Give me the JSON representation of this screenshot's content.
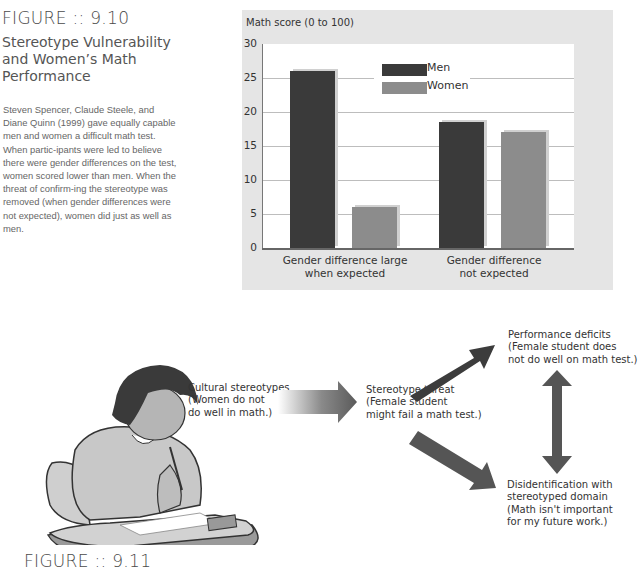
{
  "figure_9_10": {
    "label": "FIGURE :: 9.10",
    "title": "Stereotype Vulnerability and Women’s Math Performance",
    "caption": "Steven Spencer, Claude Steele, and Diane Quinn (1999) gave equally capable men and women a difficult math test. When partic-ipants were led to believe there were gender differences on the test, women scored lower than men. When the threat of confirm-ing the stereotype was removed (when gender differences were not expected), women did just as well as men."
  },
  "chart_data": {
    "type": "bar",
    "title": "",
    "ylabel": "Math score (0 to 100)",
    "xlabel": "",
    "ylim": [
      0,
      30
    ],
    "yticks": [
      "0",
      "5",
      "10",
      "15",
      "20",
      "25",
      "30"
    ],
    "grid": true,
    "legend_position": "top-center inside plot",
    "categories": [
      "Gender difference large when expected",
      "Gender difference not expected"
    ],
    "category_lines": [
      [
        "Gender difference large",
        "when expected"
      ],
      [
        "Gender difference",
        "not expected"
      ]
    ],
    "series": [
      {
        "name": "Men",
        "color": "#3a3a3a",
        "values": [
          26,
          18.5
        ]
      },
      {
        "name": "Women",
        "color": "#8c8c8c",
        "values": [
          6,
          17
        ]
      }
    ]
  },
  "figure_9_11": {
    "label": "FIGURE :: 9.11",
    "illustration": "girl-writing-math-test-at-desk",
    "nodes": {
      "cultural": [
        "Cultural stereotypes",
        "(Women do not",
        "do well in math.)"
      ],
      "threat": [
        "Stereotype threat",
        "(Female student",
        "might fail a math test.)"
      ],
      "performance": [
        "Performance deficits",
        "(Female student does",
        "not do well on math test.)"
      ],
      "disidentification": [
        "Disidentification with",
        "stereotyped domain",
        "(Math isn't important",
        "for my future work.)"
      ]
    }
  }
}
